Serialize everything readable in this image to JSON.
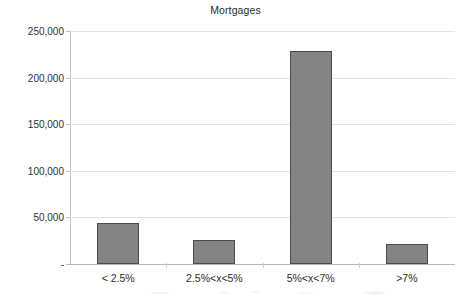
{
  "chart_data": {
    "type": "bar",
    "title": "Mortgages",
    "xlabel": "",
    "ylabel": "",
    "categories": [
      "< 2.5%",
      "2.5%<x<5%",
      "5%<x<7%",
      ">7%"
    ],
    "values": [
      44000,
      26000,
      229000,
      21000
    ],
    "series": [
      {
        "name": "Mortgages",
        "values": [
          44000,
          26000,
          229000,
          21000
        ]
      }
    ],
    "ylim": [
      0,
      250000
    ],
    "ytick_values": [
      250000,
      200000,
      150000,
      100000,
      50000,
      0
    ],
    "ytick_labels": [
      "250,000",
      "200,000",
      "150,000",
      "100,000",
      "50,000",
      "-"
    ],
    "grid": true,
    "legend": false,
    "legend_position": "none",
    "bar_color": "#848484",
    "bar_border_color": "#4a4a4a",
    "gridline_color": "#e2e2e2",
    "axis_color": "#c2c2c2",
    "background_color": "#ffffff",
    "text_color": "#2b2b2b"
  }
}
